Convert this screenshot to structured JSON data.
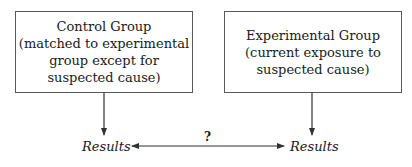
{
  "diagram": {
    "control_group": {
      "title": "Control Group",
      "lines": [
        "(matched to experimental",
        "group except for",
        "suspected cause)"
      ]
    },
    "experimental_group": {
      "title": "Experimental Group",
      "lines": [
        "(current exposure to",
        "suspected cause)"
      ]
    },
    "results_left": "Results",
    "results_right": "Results",
    "comparison_label": "?"
  }
}
